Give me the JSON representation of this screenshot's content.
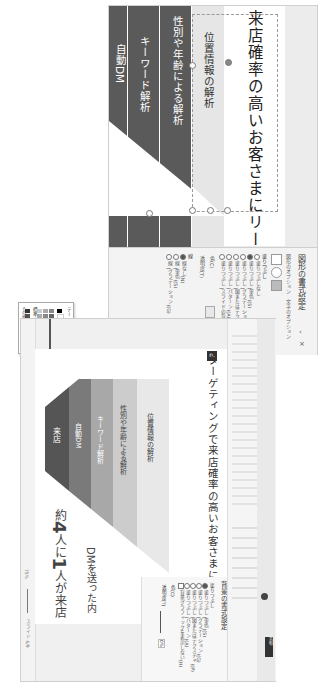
{
  "upper": {
    "slide_title": "来店確率の高いお客さまにリーチできる",
    "funnel_labels": [
      "自動DM",
      "キーワード解析",
      "性別や年齢による解析",
      "位置情報の解析"
    ],
    "colors": {
      "dark_band": "#5a5a5a",
      "light_band": "#e6e6e6",
      "slide_bg": "#ffffff"
    },
    "format_pane": {
      "title": "図形の書式設定",
      "subtitle": "図形のオプション　文字のオプション",
      "section_fill": "塗りつぶし",
      "fill_options": [
        {
          "label": "塗りつぶしなし",
          "selected": false
        },
        {
          "label": "塗りつぶし (単色)(S)",
          "selected": true
        },
        {
          "label": "塗りつぶし (グラデーション)(G)",
          "selected": false
        },
        {
          "label": "塗りつぶし (図またはテクスチャ)(P)",
          "selected": false
        },
        {
          "label": "塗りつぶし (パターン)(A)",
          "selected": false
        },
        {
          "label": "塗りつぶし (スライドの背景)(B)",
          "selected": false
        }
      ],
      "color_label": "色(C)",
      "transparency_label": "透明度(T)",
      "section_line": "線",
      "line_options": [
        {
          "label": "線なし(N)",
          "selected": true
        },
        {
          "label": "線 (単色)(S)",
          "selected": false
        },
        {
          "label": "線 (グラデーション)(G)",
          "selected": false
        }
      ],
      "collapse_icon": "‹",
      "close_icon": "×"
    },
    "palette": {
      "theme_colors_label": "テーマの色",
      "standard_colors_label": "標準の色",
      "more_colors_label": "その他の色(M)...",
      "eyedropper_label": "スポイト"
    }
  },
  "lower": {
    "slide_number_badge": "n.",
    "slide_title": "ターゲティングで来店確率の高いお客さまにリーチできる",
    "funnel_labels": [
      "来店",
      "自動DM",
      "キーワード解析",
      "性別や年齢による解析",
      "位置情報の解析"
    ],
    "funnel_colors": [
      "#555555",
      "#7a7a7a",
      "#a8a8a8",
      "#cccccc",
      "#e8e8e8"
    ],
    "bottom_text_1": "DMを送った内",
    "bottom_text_2_pre": "約",
    "bottom_text_2_num1": "4",
    "bottom_text_2_mid": "人に",
    "bottom_text_2_num2": "1",
    "bottom_text_2_post": "人が来店",
    "right_pane": {
      "title": "背景の書式設定",
      "section_fill": "塗りつぶし",
      "options": [
        {
          "label": "塗りつぶし (単色)(S)",
          "selected": true
        },
        {
          "label": "塗りつぶし (グラデーション)(G)",
          "selected": false
        },
        {
          "label": "塗りつぶし (図またはテクスチャ)(P)",
          "selected": false
        },
        {
          "label": "塗りつぶし (パターン)(A)",
          "selected": false
        },
        {
          "label": "背景グラフィックを表示しない(H)",
          "selected": false
        }
      ],
      "color_label": "色(C)",
      "transparency_label": "透明度(T)",
      "transparency_value": "0%"
    },
    "ribbon": {
      "share_label": "共有",
      "search_placeholder": "検索"
    },
    "status": {
      "slide_info": "スライド 6/9",
      "language": "日本語",
      "zoom": "75%"
    }
  }
}
